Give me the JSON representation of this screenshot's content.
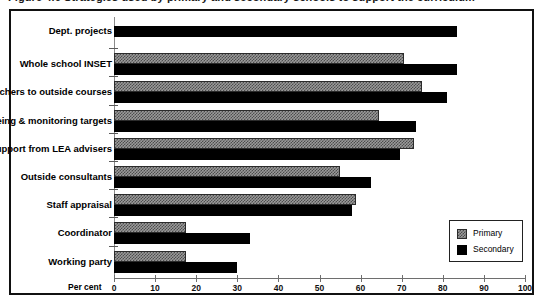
{
  "figure": {
    "title_partial": "Figure 4.6  Strategies used by primary and secondary schools to support the curriculum",
    "percent_axis_caption": "Per cent"
  },
  "legend": {
    "position": "bottom-right",
    "entries": [
      {
        "label": "Primary",
        "swatch": "primary"
      },
      {
        "label": "Secondary",
        "swatch": "secondary"
      }
    ]
  },
  "chart_data": {
    "type": "bar",
    "orientation": "horizontal",
    "title": "Figure 4.6  Strategies used by primary and secondary schools to support the curriculum",
    "xlabel": "Per cent",
    "ylabel": "",
    "xlim": [
      0,
      100
    ],
    "xticks": [
      0,
      10,
      20,
      30,
      40,
      50,
      60,
      70,
      80,
      90,
      100
    ],
    "xtick_labels": [
      "0",
      "10",
      "20",
      "30",
      "40",
      "50",
      "60",
      "70",
      "80",
      "90",
      "100"
    ],
    "grid": false,
    "categories": [
      "Dept. projects",
      "Whole school INSET",
      "Key teachers to outside courses",
      "Agreeing & monitoring targets",
      "Support from LEA advisers",
      "Outside consultants",
      "Staff appraisal",
      "Coordinator",
      "Working party"
    ],
    "series": [
      {
        "name": "Primary",
        "color": "#9a9a9a",
        "values": [
          null,
          70.5,
          75.0,
          64.5,
          73.0,
          55.0,
          59.0,
          17.5,
          17.5
        ]
      },
      {
        "name": "Secondary",
        "color": "#000000",
        "values": [
          83.5,
          83.5,
          81.0,
          73.5,
          69.5,
          62.5,
          58.0,
          33.0,
          30.0
        ]
      }
    ]
  },
  "colors": {
    "frame": "#111111",
    "axis": "#6e6e6e",
    "primary": "#9a9a9a",
    "secondary": "#000000",
    "background": "#ffffff"
  }
}
